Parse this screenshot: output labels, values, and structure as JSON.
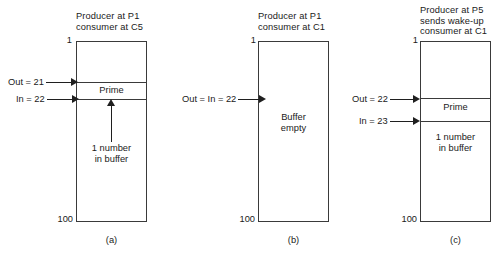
{
  "figure": {
    "type": "diagram",
    "buffer_top_index": "1",
    "buffer_bottom_index": "100"
  },
  "panels": [
    {
      "id": "a",
      "caption": "(a)",
      "title": "Producer at P1\nconsumer at C5",
      "top_index": "1",
      "bottom_index": "100",
      "cells": [
        {
          "name": "empty-top",
          "label": ""
        },
        {
          "name": "prime-slot",
          "label": "Prime"
        },
        {
          "name": "empty-bottom",
          "label": ""
        }
      ],
      "inner_note": "1 number\nin buffer",
      "pointers": [
        {
          "name": "out-pointer",
          "label": "Out = 21"
        },
        {
          "name": "in-pointer",
          "label": "In = 22"
        }
      ]
    },
    {
      "id": "b",
      "caption": "(b)",
      "title": "Producer at P1\nconsumer at C1",
      "top_index": "1",
      "bottom_index": "100",
      "cells": [
        {
          "name": "empty-buffer",
          "label": ""
        }
      ],
      "inner_note": "Buffer\nempty",
      "pointers": [
        {
          "name": "out-in-pointer",
          "label": "Out = In = 22"
        }
      ]
    },
    {
      "id": "c",
      "caption": "(c)",
      "title": "Producer at P5\nsends wake-up\nconsumer at C1",
      "top_index": "1",
      "bottom_index": "100",
      "cells": [
        {
          "name": "empty-top",
          "label": ""
        },
        {
          "name": "prime-slot",
          "label": "Prime"
        },
        {
          "name": "occupied-bottom",
          "label": ""
        }
      ],
      "inner_note": "1 number\nin buffer",
      "pointers": [
        {
          "name": "out-pointer",
          "label": "Out = 22"
        },
        {
          "name": "in-pointer",
          "label": "In = 23"
        }
      ]
    }
  ],
  "colors": {
    "stroke": "#3a3a3a",
    "arrow": "#1f1f1f",
    "text": "#1a1a1a",
    "background": "#ffffff"
  }
}
